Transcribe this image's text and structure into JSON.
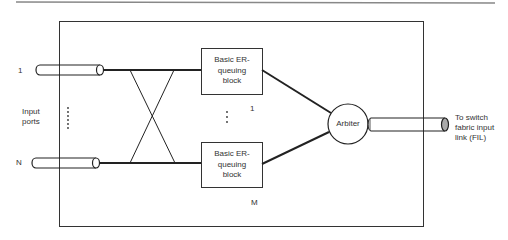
{
  "diagram": {
    "input_label": "Input\nports",
    "input_port_first": "1",
    "input_port_last": "N",
    "blocks": [
      {
        "label": "Basic ER-\nqueuing\nblock",
        "index": "1"
      },
      {
        "label": "Basic ER-\nqueuing\nblock",
        "index": "M"
      }
    ],
    "arbiter_label": "Arbiter",
    "output_label": "To switch\nfabric input\nlink (FIL)",
    "colors": {
      "line": "#222222",
      "rule": "#888888",
      "cap_fill": "#aaaaaa"
    }
  }
}
